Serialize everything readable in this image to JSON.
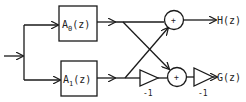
{
  "diagram": {
    "type": "signal-flow block diagram",
    "blocks": [
      {
        "id": "A0",
        "label": "A",
        "subscript": "0",
        "arg": "(z)"
      },
      {
        "id": "A1",
        "label": "A",
        "subscript": "1",
        "arg": "(z)"
      }
    ],
    "adders": [
      {
        "id": "sum_top",
        "symbol": "+"
      },
      {
        "id": "sum_bottom",
        "symbol": "+"
      }
    ],
    "gains": [
      {
        "id": "gain1",
        "value": "-1"
      },
      {
        "id": "gain2",
        "value": "-1"
      }
    ],
    "outputs": [
      {
        "id": "H",
        "label": "H(z)"
      },
      {
        "id": "G",
        "label": "G(z)"
      }
    ],
    "edges": [
      [
        "input",
        "A0"
      ],
      [
        "input",
        "A1"
      ],
      [
        "A0",
        "sum_top"
      ],
      [
        "A0",
        "sum_bottom"
      ],
      [
        "A1",
        "sum_top"
      ],
      [
        "A1",
        "gain1"
      ],
      [
        "gain1",
        "sum_bottom"
      ],
      [
        "sum_top",
        "H"
      ],
      [
        "sum_bottom",
        "gain2"
      ],
      [
        "gain2",
        "G"
      ]
    ]
  }
}
